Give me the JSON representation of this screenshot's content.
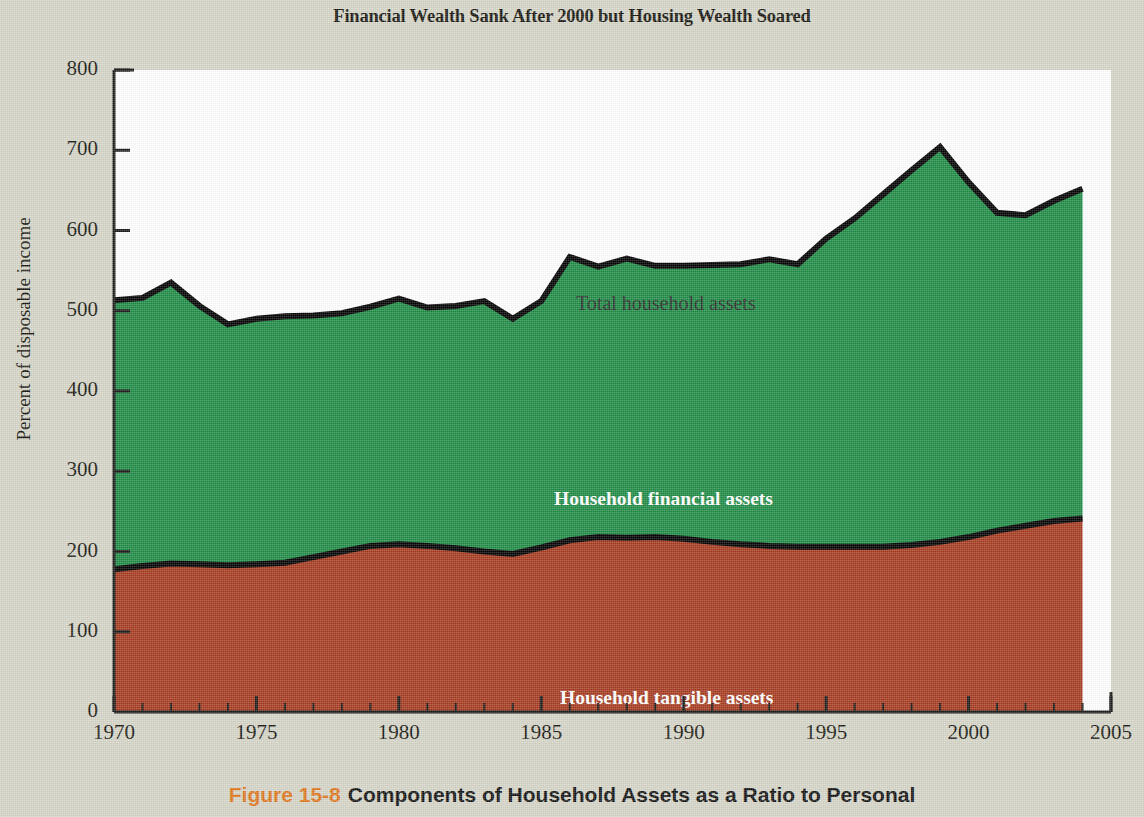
{
  "title": "Financial Wealth Sank After 2000 but Housing Wealth Soared",
  "caption": {
    "figure_number": "Figure 15-8",
    "text": "Components of Household Assets as a Ratio to Personal"
  },
  "labels": {
    "total": "Total household assets",
    "financial": "Household financial assets",
    "tangible": "Household tangible assets"
  },
  "colors": {
    "financial_area": "#1e8b44",
    "tangible_area": "#a63a20",
    "line": "#000000",
    "background": "#d5d5c8",
    "plot_background": "#ffffff",
    "figure_number": "#e0761a"
  },
  "chart_data": {
    "type": "area",
    "title": "Financial Wealth Sank After 2000 but Housing Wealth Soared",
    "xlabel": "",
    "ylabel": "Percent of disposable income",
    "xlim": [
      1970,
      2005
    ],
    "ylim": [
      0,
      800
    ],
    "xticks": [
      1970,
      1975,
      1980,
      1985,
      1990,
      1995,
      2000,
      2005
    ],
    "yticks": [
      0,
      100,
      200,
      300,
      400,
      500,
      600,
      700,
      800
    ],
    "minor_xtick_interval": 1,
    "grid": false,
    "legend": "in-plot annotations",
    "stacked": true,
    "x": [
      1970,
      1971,
      1972,
      1973,
      1974,
      1975,
      1976,
      1977,
      1978,
      1979,
      1980,
      1981,
      1982,
      1983,
      1984,
      1985,
      1986,
      1987,
      1988,
      1989,
      1990,
      1991,
      1992,
      1993,
      1994,
      1995,
      1996,
      1997,
      1998,
      1999,
      2000,
      2001,
      2002,
      2003,
      2004
    ],
    "series": [
      {
        "name": "Household tangible assets",
        "color": "#a63a20",
        "values": [
          178,
          182,
          185,
          184,
          183,
          184,
          186,
          193,
          200,
          207,
          209,
          207,
          204,
          200,
          197,
          205,
          214,
          218,
          217,
          218,
          216,
          212,
          209,
          207,
          206,
          206,
          206,
          206,
          208,
          212,
          218,
          226,
          232,
          238,
          241
        ]
      },
      {
        "name": "Household financial assets",
        "color": "#1e8b44",
        "values": [
          335,
          334,
          350,
          322,
          300,
          306,
          307,
          301,
          297,
          298,
          306,
          297,
          302,
          312,
          293,
          307,
          353,
          337,
          348,
          338,
          340,
          345,
          349,
          357,
          352,
          384,
          409,
          439,
          467,
          492,
          442,
          396,
          387,
          399,
          411
        ]
      }
    ],
    "total_series": {
      "name": "Total household assets",
      "values": [
        513,
        516,
        535,
        506,
        483,
        490,
        493,
        494,
        497,
        505,
        515,
        504,
        506,
        512,
        490,
        512,
        567,
        555,
        565,
        556,
        556,
        557,
        558,
        564,
        558,
        590,
        615,
        645,
        675,
        704,
        660,
        622,
        619,
        637,
        652
      ]
    }
  }
}
